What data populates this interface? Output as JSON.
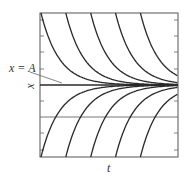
{
  "figure": {
    "equilibrium_label": "x = A",
    "y_axis_label": "x",
    "x_axis_label": "t",
    "line_color": "#2a2a2a",
    "frame_color": "#555555"
  },
  "chart_data": {
    "type": "line",
    "title": "",
    "xlabel": "t",
    "ylabel": "x",
    "annotations": [
      "x = A"
    ],
    "grid": false,
    "equilibrium": {
      "label": "x = A",
      "y_fraction": 0.5
    },
    "reference_line_y_fraction": 0.28,
    "curve_start_t_fractions": [
      0.0,
      0.18,
      0.36,
      0.54,
      0.72
    ],
    "families": [
      "above",
      "below"
    ]
  }
}
